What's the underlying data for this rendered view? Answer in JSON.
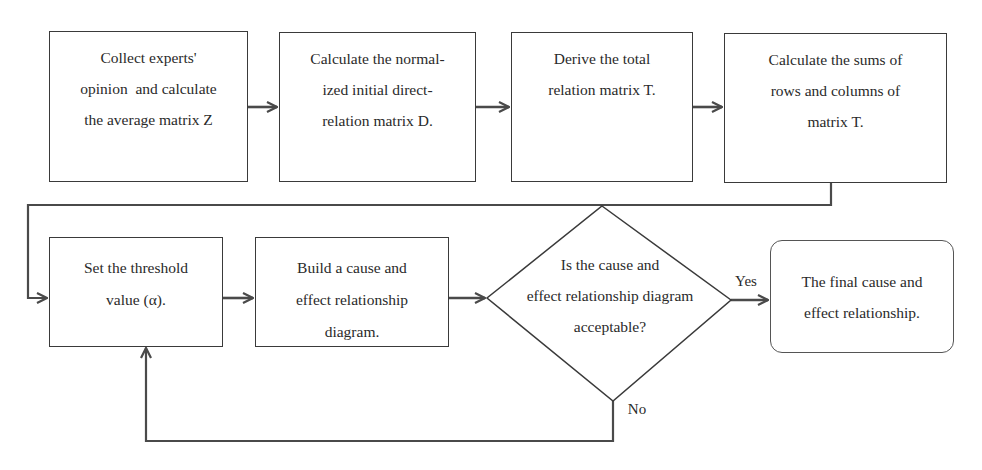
{
  "diagram": {
    "type": "flowchart",
    "title": "",
    "colors": {
      "stroke": "#3a3a3a",
      "text": "#2a2a2a",
      "background": "#ffffff"
    },
    "nodes": [
      {
        "id": "n1",
        "shape": "rectangle",
        "lines": [
          "Collect experts'",
          "opinion  and calculate",
          "the average matrix Z"
        ]
      },
      {
        "id": "n2",
        "shape": "rectangle",
        "lines": [
          "Calculate the normal-",
          "ized initial direct-",
          "relation matrix D."
        ]
      },
      {
        "id": "n3",
        "shape": "rectangle",
        "lines": [
          "Derive the total",
          "relation matrix T."
        ]
      },
      {
        "id": "n4",
        "shape": "rectangle",
        "lines": [
          "Calculate the sums of",
          "rows and columns of",
          "matrix T."
        ]
      },
      {
        "id": "n5",
        "shape": "rectangle",
        "lines": [
          "Set the threshold",
          "value (α)."
        ]
      },
      {
        "id": "n6",
        "shape": "rectangle",
        "lines": [
          "Build a cause and",
          "effect relationship",
          "diagram."
        ]
      },
      {
        "id": "n7",
        "shape": "diamond",
        "lines": [
          "Is the cause and",
          "effect relationship diagram",
          "acceptable?"
        ]
      },
      {
        "id": "n8",
        "shape": "rounded-rectangle",
        "lines": [
          "The final cause and",
          "effect relationship."
        ]
      }
    ],
    "edges": [
      {
        "from": "n1",
        "to": "n2",
        "label": ""
      },
      {
        "from": "n2",
        "to": "n3",
        "label": ""
      },
      {
        "from": "n3",
        "to": "n4",
        "label": ""
      },
      {
        "from": "n4",
        "to": "n5",
        "label": ""
      },
      {
        "from": "n5",
        "to": "n6",
        "label": ""
      },
      {
        "from": "n6",
        "to": "n7",
        "label": ""
      },
      {
        "from": "n7",
        "to": "n8",
        "label": "Yes"
      },
      {
        "from": "n7",
        "to": "n5",
        "label": "No"
      }
    ],
    "edge_labels": {
      "yes": "Yes",
      "no": "No"
    }
  }
}
